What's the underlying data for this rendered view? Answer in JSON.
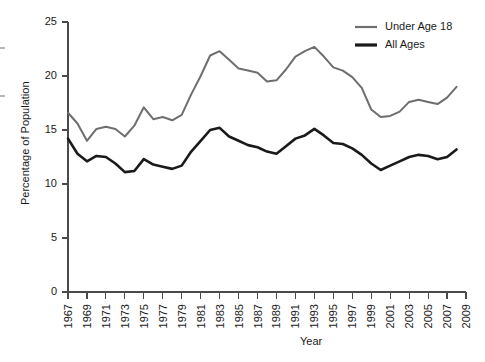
{
  "chart_data": {
    "type": "line",
    "title": "",
    "xlabel": "Year",
    "ylabel": "Percentage of Population",
    "xlim": [
      1967,
      2009
    ],
    "ylim": [
      0,
      25
    ],
    "yticks": [
      0,
      5,
      10,
      15,
      20,
      25
    ],
    "xticks": [
      1967,
      1969,
      1971,
      1973,
      1975,
      1977,
      1979,
      1981,
      1983,
      1985,
      1987,
      1989,
      1991,
      1993,
      1995,
      1997,
      1999,
      2001,
      2003,
      2005,
      2007,
      2009
    ],
    "grid": false,
    "legend_position": "top-right",
    "x": [
      1967,
      1968,
      1969,
      1970,
      1971,
      1972,
      1973,
      1974,
      1975,
      1976,
      1977,
      1978,
      1979,
      1980,
      1981,
      1982,
      1983,
      1984,
      1985,
      1986,
      1987,
      1988,
      1989,
      1990,
      1991,
      1992,
      1993,
      1994,
      1995,
      1996,
      1997,
      1998,
      1999,
      2000,
      2001,
      2002,
      2003,
      2004,
      2005,
      2006,
      2007,
      2008
    ],
    "series": [
      {
        "name": "Under Age 18",
        "color": "#6e6e6e",
        "values": [
          16.6,
          15.6,
          14.0,
          15.1,
          15.3,
          15.1,
          14.4,
          15.4,
          17.1,
          16.0,
          16.2,
          15.9,
          16.4,
          18.3,
          20.0,
          21.9,
          22.3,
          21.5,
          20.7,
          20.5,
          20.3,
          19.5,
          19.6,
          20.6,
          21.8,
          22.3,
          22.7,
          21.8,
          20.8,
          20.5,
          19.9,
          18.9,
          16.9,
          16.2,
          16.3,
          16.7,
          17.6,
          17.8,
          17.6,
          17.4,
          18.0,
          19.0
        ]
      },
      {
        "name": "All Ages",
        "color": "#1a1a1a",
        "values": [
          14.2,
          12.8,
          12.1,
          12.6,
          12.5,
          11.9,
          11.1,
          11.2,
          12.3,
          11.8,
          11.6,
          11.4,
          11.7,
          13.0,
          14.0,
          15.0,
          15.2,
          14.4,
          14.0,
          13.6,
          13.4,
          13.0,
          12.8,
          13.5,
          14.2,
          14.5,
          15.1,
          14.5,
          13.8,
          13.7,
          13.3,
          12.7,
          11.9,
          11.3,
          11.7,
          12.1,
          12.5,
          12.7,
          12.6,
          12.3,
          12.5,
          13.2
        ]
      }
    ]
  },
  "legend": {
    "items": [
      {
        "label": "Under Age 18",
        "color": "#6e6e6e"
      },
      {
        "label": "All Ages",
        "color": "#1a1a1a"
      }
    ]
  },
  "axes": {
    "y_title": "Percentage of Population",
    "x_title": "Year"
  }
}
